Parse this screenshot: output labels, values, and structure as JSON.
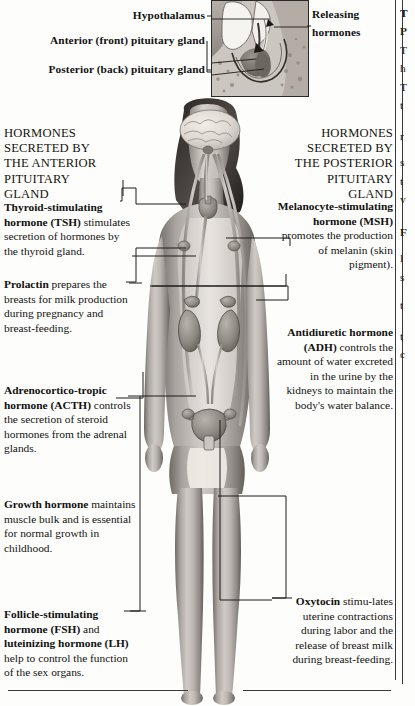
{
  "page": {
    "background": "#fdfdfb",
    "ink": "#121212"
  },
  "inset": {
    "name": "hypothalamus-pituitary-cross-section",
    "labels": {
      "hypothalamus": "Hypothalamus",
      "anterior": "Anterior (front) pituitary gland",
      "posterior": "Posterior (back) pituitary gland",
      "releasing": "Releasing\nhormones",
      "releasing_line1": "Releasing",
      "releasing_line2": "hormones"
    }
  },
  "left_column": {
    "heading": "HORMONES SECRETED BY THE ANTERIOR PITUITARY GLAND",
    "heading_lines": [
      "HORMONES",
      "SECRETED BY",
      "THE ANTERIOR",
      "PITUITARY",
      "GLAND"
    ],
    "entries": [
      {
        "id": "tsh",
        "term": "Thyroid-stimulating hormone (TSH)",
        "text": " stimulates secretion of hormones by the thyroid gland."
      },
      {
        "id": "prolactin",
        "term": "Prolactin",
        "text": " prepares the breasts for milk production during pregnancy and breast-feeding."
      },
      {
        "id": "acth",
        "term": "Adrenocortico-tropic hormone (ACTH)",
        "text": " controls the secretion of steroid hormones from the adrenal glands."
      },
      {
        "id": "growth-hormone",
        "term": "Growth hormone",
        "text": " maintains muscle bulk and is essential for normal growth in childhood."
      },
      {
        "id": "fsh-lh",
        "term": "Follicle-stimulating hormone (FSH)",
        "mid": " and ",
        "term2": "luteinizing hormone (LH)",
        "text": " help to control the function of the sex organs."
      }
    ]
  },
  "right_column": {
    "heading": "HORMONES SECRETED BY THE POSTERIOR PITUITARY GLAND",
    "heading_lines": [
      "HORMONES",
      "SECRETED BY",
      "THE POSTERIOR",
      "PITUITARY",
      "GLAND"
    ],
    "entries": [
      {
        "id": "msh",
        "term": "Melanocyte-stimulating hormone (MSH)",
        "text": " promotes the production of melanin (skin pigment)."
      },
      {
        "id": "adh",
        "term": "Antidiuretic hormone (ADH)",
        "text": " controls the amount of water excreted in the urine by the kidneys to maintain the body's water balance."
      },
      {
        "id": "oxytocin",
        "term": "Oxytocin",
        "text": " stimu-lates uterine contractions during labor and the release of breast milk during breast-feeding."
      }
    ]
  },
  "figure": {
    "name": "female-endocrine-system-photograph"
  }
}
